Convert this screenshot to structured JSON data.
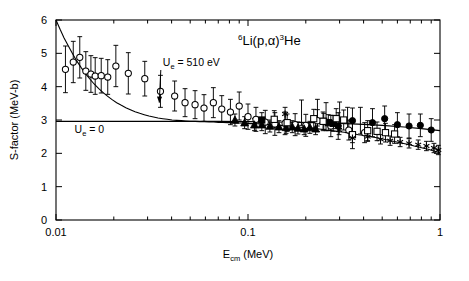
{
  "chart_data": {
    "type": "scatter",
    "title": "6Li(p,α)3He",
    "title_parts": {
      "mass_number_target": "6",
      "target": "Li(p,",
      "alpha": "α",
      "close": ")",
      "mass_number_product": "3",
      "product": "He"
    },
    "xlabel": "Ecm (MeV)",
    "xlabel_parts": {
      "symbol": "E",
      "subscript": "cm",
      "units": " (MeV)"
    },
    "ylabel": "S-factor (MeV-b)",
    "xscale": "log",
    "yscale": "linear",
    "xlim": [
      0.01,
      1.0
    ],
    "ylim": [
      0,
      6
    ],
    "xticks_major": [
      0.01,
      0.1,
      1
    ],
    "xtick_labels": [
      "0.01",
      "0.1",
      "1"
    ],
    "yticks": [
      0,
      1,
      2,
      3,
      4,
      5,
      6
    ],
    "ytick_labels": [
      "0",
      "1",
      "2",
      "3",
      "4",
      "5",
      "6"
    ],
    "grid": false,
    "legend": "none",
    "annotations": [
      {
        "text": "Ue = 510 eV",
        "parts": {
          "symbol": "U",
          "subscript": "e",
          "value": " = 510 eV"
        },
        "x_data": 0.036,
        "y_data": 4.62,
        "arrow_to_x": 0.0345,
        "arrow_to_y": 3.52
      },
      {
        "text": "Ue = 0",
        "parts": {
          "symbol": "U",
          "subscript": "e",
          "value": " = 0"
        },
        "x_data": 0.0125,
        "y_data": 2.62
      }
    ],
    "curves": [
      {
        "name": "screened-s-factor-Ue-510eV",
        "label": "Ue = 510 eV",
        "style": "solid",
        "points": [
          [
            0.01,
            6.0
          ],
          [
            0.0105,
            5.72
          ],
          [
            0.011,
            5.47
          ],
          [
            0.0116,
            5.22
          ],
          [
            0.0122,
            4.99
          ],
          [
            0.0128,
            4.78
          ],
          [
            0.0135,
            4.58
          ],
          [
            0.0142,
            4.4
          ],
          [
            0.015,
            4.23
          ],
          [
            0.0158,
            4.08
          ],
          [
            0.0167,
            3.94
          ],
          [
            0.0176,
            3.82
          ],
          [
            0.0186,
            3.71
          ],
          [
            0.0196,
            3.61
          ],
          [
            0.0207,
            3.52
          ],
          [
            0.0219,
            3.44
          ],
          [
            0.0231,
            3.37
          ],
          [
            0.0244,
            3.31
          ],
          [
            0.0258,
            3.25
          ],
          [
            0.0273,
            3.2
          ],
          [
            0.0288,
            3.16
          ],
          [
            0.0305,
            3.12
          ],
          [
            0.0322,
            3.09
          ],
          [
            0.034,
            3.06
          ],
          [
            0.036,
            3.04
          ],
          [
            0.038,
            3.02
          ],
          [
            0.0402,
            3.0
          ],
          [
            0.0425,
            2.99
          ],
          [
            0.0449,
            2.98
          ],
          [
            0.0475,
            2.97
          ],
          [
            0.0502,
            2.96
          ],
          [
            0.0531,
            2.96
          ],
          [
            0.0561,
            2.95
          ],
          [
            0.0593,
            2.95
          ],
          [
            0.0627,
            2.94
          ],
          [
            0.0663,
            2.94
          ],
          [
            0.0701,
            2.93
          ],
          [
            0.0741,
            2.93
          ],
          [
            0.0784,
            2.92
          ],
          [
            0.0829,
            2.92
          ],
          [
            0.0877,
            2.91
          ],
          [
            0.0927,
            2.91
          ],
          [
            0.098,
            2.9
          ],
          [
            0.1036,
            2.89
          ],
          [
            0.1096,
            2.89
          ],
          [
            0.1159,
            2.88
          ],
          [
            0.1226,
            2.87
          ],
          [
            0.1296,
            2.86
          ],
          [
            0.1371,
            2.85
          ],
          [
            0.145,
            2.84
          ],
          [
            0.1533,
            2.83
          ],
          [
            0.1621,
            2.82
          ],
          [
            0.1715,
            2.81
          ],
          [
            0.1813,
            2.79
          ],
          [
            0.1918,
            2.78
          ],
          [
            0.2028,
            2.77
          ],
          [
            0.2145,
            2.75
          ],
          [
            0.2268,
            2.74
          ],
          [
            0.2399,
            2.72
          ],
          [
            0.2537,
            2.7
          ],
          [
            0.2683,
            2.69
          ],
          [
            0.2837,
            2.67
          ],
          [
            0.3,
            2.65
          ],
          [
            0.3173,
            2.63
          ],
          [
            0.3355,
            2.61
          ],
          [
            0.3548,
            2.59
          ],
          [
            0.3752,
            2.56
          ],
          [
            0.3968,
            2.54
          ],
          [
            0.4196,
            2.52
          ],
          [
            0.4437,
            2.49
          ],
          [
            0.4692,
            2.47
          ],
          [
            0.4962,
            2.44
          ],
          [
            0.5247,
            2.41
          ],
          [
            0.5549,
            2.38
          ],
          [
            0.5868,
            2.35
          ],
          [
            0.6205,
            2.32
          ],
          [
            0.6562,
            2.29
          ],
          [
            0.6939,
            2.26
          ],
          [
            0.7338,
            2.22
          ],
          [
            0.776,
            2.19
          ],
          [
            0.8206,
            2.15
          ],
          [
            0.8678,
            2.12
          ],
          [
            0.9177,
            2.08
          ],
          [
            0.9705,
            2.04
          ],
          [
            1.0,
            2.02
          ]
        ]
      },
      {
        "name": "bare-s-factor-Ue-0",
        "label": "Ue = 0",
        "style": "solid",
        "points": [
          [
            0.01,
            2.96
          ],
          [
            0.015,
            2.96
          ],
          [
            0.023,
            2.96
          ],
          [
            0.035,
            2.96
          ],
          [
            0.05,
            2.96
          ],
          [
            0.07,
            2.96
          ],
          [
            0.1,
            2.95
          ],
          [
            0.14,
            2.94
          ],
          [
            0.18,
            2.93
          ],
          [
            0.23,
            2.92
          ],
          [
            0.3,
            2.9
          ],
          [
            0.4,
            2.87
          ],
          [
            0.5,
            2.84
          ],
          [
            0.65,
            2.79
          ],
          [
            0.8,
            2.74
          ],
          [
            1.0,
            2.68
          ]
        ]
      }
    ],
    "series": [
      {
        "name": "open-circles",
        "marker": "open-circle",
        "points": [
          {
            "x": 0.0112,
            "y": 4.52,
            "yerr": 0.7
          },
          {
            "x": 0.0123,
            "y": 4.74,
            "yerr": 0.62
          },
          {
            "x": 0.0133,
            "y": 4.88,
            "yerr": 0.62
          },
          {
            "x": 0.0143,
            "y": 4.47,
            "yerr": 0.58
          },
          {
            "x": 0.0152,
            "y": 4.38,
            "yerr": 0.55
          },
          {
            "x": 0.016,
            "y": 4.32,
            "yerr": 0.55
          },
          {
            "x": 0.0172,
            "y": 4.33,
            "yerr": 0.52
          },
          {
            "x": 0.0186,
            "y": 4.29,
            "yerr": 0.52
          },
          {
            "x": 0.0205,
            "y": 4.62,
            "yerr": 0.62
          },
          {
            "x": 0.0238,
            "y": 4.4,
            "yerr": 0.62
          },
          {
            "x": 0.029,
            "y": 4.24,
            "yerr": 0.52
          },
          {
            "x": 0.035,
            "y": 3.86,
            "yerr": 0.48
          },
          {
            "x": 0.0415,
            "y": 3.72,
            "yerr": 0.45
          },
          {
            "x": 0.047,
            "y": 3.52,
            "yerr": 0.42
          },
          {
            "x": 0.053,
            "y": 3.46,
            "yerr": 0.42
          },
          {
            "x": 0.059,
            "y": 3.36,
            "yerr": 0.4
          },
          {
            "x": 0.066,
            "y": 3.52,
            "yerr": 0.45
          },
          {
            "x": 0.073,
            "y": 3.33,
            "yerr": 0.4
          },
          {
            "x": 0.081,
            "y": 3.24,
            "yerr": 0.38
          },
          {
            "x": 0.09,
            "y": 3.42,
            "yerr": 0.42
          },
          {
            "x": 0.1,
            "y": 3.1,
            "yerr": 0.38
          },
          {
            "x": 0.11,
            "y": 3.02,
            "yerr": 0.36
          },
          {
            "x": 0.123,
            "y": 2.94,
            "yerr": 0.35
          },
          {
            "x": 0.138,
            "y": 2.88,
            "yerr": 0.34
          },
          {
            "x": 0.156,
            "y": 2.9,
            "yerr": 0.34
          },
          {
            "x": 0.176,
            "y": 2.86,
            "yerr": 0.33
          },
          {
            "x": 0.2,
            "y": 2.84,
            "yerr": 0.33
          },
          {
            "x": 0.23,
            "y": 2.98,
            "yerr": 0.33
          },
          {
            "x": 0.27,
            "y": 2.82,
            "yerr": 0.32
          },
          {
            "x": 0.335,
            "y": 2.7,
            "yerr": 0.3
          },
          {
            "x": 0.405,
            "y": 2.62,
            "yerr": 0.3
          }
        ]
      },
      {
        "name": "filled-triangles",
        "marker": "filled-triangle",
        "points": [
          {
            "x": 0.0855,
            "y": 3.0,
            "yerr": 0.18
          },
          {
            "x": 0.096,
            "y": 2.92,
            "yerr": 0.18
          },
          {
            "x": 0.108,
            "y": 2.86,
            "yerr": 0.18
          },
          {
            "x": 0.118,
            "y": 2.86,
            "yerr": 0.18
          },
          {
            "x": 0.13,
            "y": 2.82,
            "yerr": 0.18
          },
          {
            "x": 0.145,
            "y": 2.8,
            "yerr": 0.18
          },
          {
            "x": 0.158,
            "y": 2.78,
            "yerr": 0.18
          },
          {
            "x": 0.17,
            "y": 2.8,
            "yerr": 0.18
          },
          {
            "x": 0.182,
            "y": 2.76,
            "yerr": 0.18
          },
          {
            "x": 0.196,
            "y": 2.74,
            "yerr": 0.18
          },
          {
            "x": 0.21,
            "y": 2.78,
            "yerr": 0.18
          },
          {
            "x": 0.225,
            "y": 2.74,
            "yerr": 0.18
          }
        ]
      },
      {
        "name": "filled-squares",
        "marker": "filled-square",
        "points": [
          {
            "x": 0.118,
            "y": 3.0,
            "yerr": 0.22
          },
          {
            "x": 0.248,
            "y": 2.96,
            "yerr": 0.24
          },
          {
            "x": 0.262,
            "y": 2.92,
            "yerr": 0.24
          },
          {
            "x": 0.278,
            "y": 2.9,
            "yerr": 0.24
          }
        ]
      },
      {
        "name": "open-squares",
        "marker": "open-square",
        "points": [
          {
            "x": 0.137,
            "y": 3.02,
            "yerr": 0.26
          },
          {
            "x": 0.16,
            "y": 2.92,
            "yerr": 0.26
          },
          {
            "x": 0.22,
            "y": 3.04,
            "yerr": 0.28
          },
          {
            "x": 0.246,
            "y": 2.96,
            "yerr": 0.28
          },
          {
            "x": 0.288,
            "y": 3.04,
            "yerr": 0.3
          },
          {
            "x": 0.315,
            "y": 3.0,
            "yerr": 0.3
          },
          {
            "x": 0.35,
            "y": 2.56,
            "yerr": 0.42
          },
          {
            "x": 0.42,
            "y": 2.68,
            "yerr": 0.3
          },
          {
            "x": 0.47,
            "y": 2.66,
            "yerr": 0.28
          },
          {
            "x": 0.52,
            "y": 2.62,
            "yerr": 0.28
          },
          {
            "x": 0.58,
            "y": 2.58,
            "yerr": 0.28
          }
        ]
      },
      {
        "name": "filled-circles",
        "marker": "filled-circle",
        "points": [
          {
            "x": 0.295,
            "y": 2.82,
            "yerr": 0.4
          },
          {
            "x": 0.35,
            "y": 2.98,
            "yerr": 0.38
          },
          {
            "x": 0.445,
            "y": 2.92,
            "yerr": 0.42
          },
          {
            "x": 0.515,
            "y": 3.04,
            "yerr": 0.38
          },
          {
            "x": 0.6,
            "y": 2.86,
            "yerr": 0.36
          },
          {
            "x": 0.69,
            "y": 2.82,
            "yerr": 0.36
          },
          {
            "x": 0.79,
            "y": 2.84,
            "yerr": 0.34
          },
          {
            "x": 0.9,
            "y": 2.7,
            "yerr": 0.34
          }
        ]
      },
      {
        "name": "crosses-asterisks",
        "marker": "asterisk",
        "points": [
          {
            "x": 0.156,
            "y": 3.18,
            "yerr": 0.2
          },
          {
            "x": 0.298,
            "y": 2.7,
            "yerr": 0.14
          },
          {
            "x": 0.35,
            "y": 2.46,
            "yerr": 0.14
          },
          {
            "x": 0.42,
            "y": 2.5,
            "yerr": 0.14
          },
          {
            "x": 0.49,
            "y": 2.42,
            "yerr": 0.14
          },
          {
            "x": 0.55,
            "y": 2.38,
            "yerr": 0.14
          },
          {
            "x": 0.62,
            "y": 2.34,
            "yerr": 0.14
          },
          {
            "x": 0.69,
            "y": 2.3,
            "yerr": 0.14
          },
          {
            "x": 0.77,
            "y": 2.26,
            "yerr": 0.14
          },
          {
            "x": 0.85,
            "y": 2.22,
            "yerr": 0.14
          },
          {
            "x": 0.93,
            "y": 2.16,
            "yerr": 0.14
          },
          {
            "x": 0.98,
            "y": 2.1,
            "yerr": 0.14
          }
        ]
      },
      {
        "name": "plain-error-bars",
        "marker": "none",
        "points": [
          {
            "x": 0.255,
            "y": 3.1,
            "yerr": 0.42
          },
          {
            "x": 0.23,
            "y": 3.22,
            "yerr": 0.4
          },
          {
            "x": 0.3,
            "y": 3.14,
            "yerr": 0.4
          },
          {
            "x": 0.33,
            "y": 3.0,
            "yerr": 0.38
          },
          {
            "x": 0.385,
            "y": 2.98,
            "yerr": 0.4
          },
          {
            "x": 0.19,
            "y": 3.22,
            "yerr": 0.38
          }
        ]
      }
    ]
  },
  "colors": {
    "axis": "#000000",
    "marker": "#000000",
    "curve": "#000000",
    "background": "#ffffff"
  }
}
